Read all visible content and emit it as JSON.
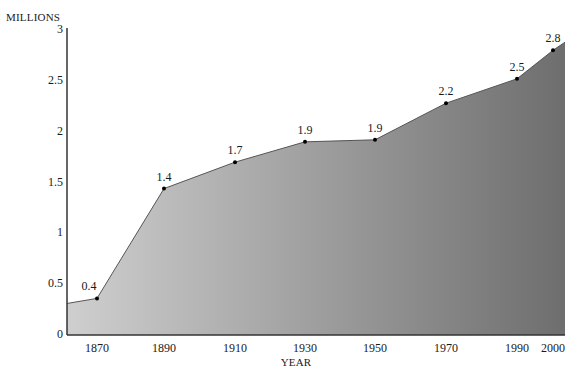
{
  "chart_data": {
    "type": "area",
    "title": "",
    "ylabel": "MILLIONS",
    "xlabel": "YEAR",
    "ylim": [
      0,
      3
    ],
    "xlim": [
      1863,
      2003
    ],
    "grid": false,
    "legend": null,
    "y_ticks": [
      "0",
      "0.5",
      "1",
      "1.5",
      "2",
      "2.5",
      "3"
    ],
    "x_ticks": [
      "1870",
      "1890",
      "1910",
      "1930",
      "1950",
      "1970",
      "1990",
      "2000"
    ],
    "x": [
      1870,
      1890,
      1910,
      1930,
      1950,
      1970,
      1990,
      2000
    ],
    "values": [
      0.36,
      1.44,
      1.7,
      1.9,
      1.92,
      2.28,
      2.52,
      2.8
    ],
    "labels": [
      "0.4",
      "1.4",
      "1.7",
      "1.9",
      "1.9",
      "2.2",
      "2.5",
      "2.8"
    ],
    "start_value": 0.31,
    "end_value": 2.88,
    "fill_gradient": [
      "#cfcfcf",
      "#6e6e6e"
    ],
    "line_color": "#555555",
    "marker_color": "#000000"
  }
}
